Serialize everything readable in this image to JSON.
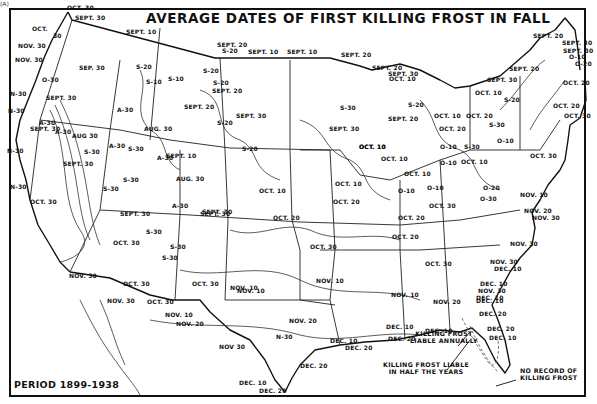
{
  "map": {
    "corner_mark": "(A)",
    "title": "AVERAGE DATES OF FIRST KILLING FROST IN FALL",
    "period": "PERIOD 1899-1938",
    "notes": {
      "annual": [
        "KILLING FROST",
        "LIABLE ANNUALLY"
      ],
      "half_years": [
        "KILLING FROST LIABLE",
        "IN HALF THE YEARS"
      ],
      "no_record": [
        "NO RECORD OF",
        "KILLING FROST"
      ]
    },
    "isoline_labels": [
      {
        "text": "OCT. 30",
        "x": 67,
        "y": 9
      },
      {
        "text": "SEPT. 30",
        "x": 75,
        "y": 19
      },
      {
        "text": "OCT.",
        "x": 32,
        "y": 30
      },
      {
        "text": "30",
        "x": 53,
        "y": 37
      },
      {
        "text": "NOV. 30",
        "x": 18,
        "y": 47
      },
      {
        "text": "NOV. 30",
        "x": 15,
        "y": 61
      },
      {
        "text": "SEPT. 10",
        "x": 126,
        "y": 33
      },
      {
        "text": "SEP. 30",
        "x": 79,
        "y": 69
      },
      {
        "text": "O-30",
        "x": 42,
        "y": 81
      },
      {
        "text": "N-30",
        "x": 10,
        "y": 95
      },
      {
        "text": "SEPT. 30",
        "x": 46,
        "y": 99
      },
      {
        "text": "S-20",
        "x": 136,
        "y": 68
      },
      {
        "text": "S-10",
        "x": 146,
        "y": 83
      },
      {
        "text": "S-10",
        "x": 168,
        "y": 80
      },
      {
        "text": "SEPT. 20",
        "x": 217,
        "y": 46
      },
      {
        "text": "S-20",
        "x": 222,
        "y": 52
      },
      {
        "text": "SEPT. 10",
        "x": 248,
        "y": 53
      },
      {
        "text": "SEPT. 10",
        "x": 287,
        "y": 53
      },
      {
        "text": "S-20",
        "x": 203,
        "y": 72
      },
      {
        "text": "S-20",
        "x": 213,
        "y": 84
      },
      {
        "text": "SEPT. 20",
        "x": 212,
        "y": 92
      },
      {
        "text": "SEPT. 20",
        "x": 341,
        "y": 56
      },
      {
        "text": "SEPT. 20",
        "x": 372,
        "y": 69
      },
      {
        "text": "SEPT. 30",
        "x": 388,
        "y": 75
      },
      {
        "text": "OCT. 10",
        "x": 389,
        "y": 80
      },
      {
        "text": "SEPT. 20",
        "x": 533,
        "y": 37
      },
      {
        "text": "SEPT. 30",
        "x": 562,
        "y": 44
      },
      {
        "text": "SEPT. 30",
        "x": 563,
        "y": 52
      },
      {
        "text": "O-10",
        "x": 569,
        "y": 58
      },
      {
        "text": "O-20",
        "x": 575,
        "y": 65
      },
      {
        "text": "OCT. 20",
        "x": 563,
        "y": 84
      },
      {
        "text": "SEPT. 20",
        "x": 509,
        "y": 70
      },
      {
        "text": "SEPT. 30",
        "x": 487,
        "y": 81
      },
      {
        "text": "OCT. 10",
        "x": 475,
        "y": 94
      },
      {
        "text": "S-20",
        "x": 504,
        "y": 101
      },
      {
        "text": "OCT. 20",
        "x": 553,
        "y": 107
      },
      {
        "text": "OCT. 30",
        "x": 564,
        "y": 117
      },
      {
        "text": "SEPT. 20",
        "x": 184,
        "y": 108
      },
      {
        "text": "A-30",
        "x": 117,
        "y": 111
      },
      {
        "text": "AUG. 30",
        "x": 144,
        "y": 130
      },
      {
        "text": "SEPT. 30",
        "x": 236,
        "y": 117
      },
      {
        "text": "S-20",
        "x": 217,
        "y": 124
      },
      {
        "text": "S-20",
        "x": 242,
        "y": 150
      },
      {
        "text": "N-30",
        "x": 8,
        "y": 112
      },
      {
        "text": "A-30",
        "x": 39,
        "y": 124
      },
      {
        "text": "A-30",
        "x": 55,
        "y": 133
      },
      {
        "text": "AUG 30",
        "x": 72,
        "y": 137
      },
      {
        "text": "A-30",
        "x": 109,
        "y": 147
      },
      {
        "text": "S-30",
        "x": 128,
        "y": 150
      },
      {
        "text": "N-30",
        "x": 7,
        "y": 152
      },
      {
        "text": "S-30",
        "x": 84,
        "y": 153
      },
      {
        "text": "SEPT. 30",
        "x": 63,
        "y": 165
      },
      {
        "text": "SEPT. 10",
        "x": 166,
        "y": 157
      },
      {
        "text": "A-30",
        "x": 157,
        "y": 159
      },
      {
        "text": "S-30",
        "x": 123,
        "y": 181
      },
      {
        "text": "N-30",
        "x": 10,
        "y": 188
      },
      {
        "text": "S-30",
        "x": 103,
        "y": 190
      },
      {
        "text": "AUG. 30",
        "x": 176,
        "y": 180
      },
      {
        "text": "OCT. 10",
        "x": 259,
        "y": 192
      },
      {
        "text": "SEPT. 30",
        "x": 30,
        "y": 130
      },
      {
        "text": "A-30",
        "x": 172,
        "y": 207
      },
      {
        "text": "SEPT. 30",
        "x": 202,
        "y": 213
      },
      {
        "text": "OCT. 30",
        "x": 30,
        "y": 203
      },
      {
        "text": "SEPT. 30",
        "x": 120,
        "y": 215
      },
      {
        "text": "S-30",
        "x": 146,
        "y": 233
      },
      {
        "text": "SEPT. 30",
        "x": 200,
        "y": 215
      },
      {
        "text": "OCT. 20",
        "x": 273,
        "y": 219
      },
      {
        "text": "S-30",
        "x": 170,
        "y": 248
      },
      {
        "text": "OCT. 30",
        "x": 113,
        "y": 244
      },
      {
        "text": "S-30",
        "x": 162,
        "y": 259
      },
      {
        "text": "OCT. 10",
        "x": 381,
        "y": 160
      },
      {
        "text": "SEPT. 30",
        "x": 329,
        "y": 130
      },
      {
        "text": "OCT. 10",
        "x": 359,
        "y": 148
      },
      {
        "text": "S-30",
        "x": 340,
        "y": 109
      },
      {
        "text": "S-20",
        "x": 408,
        "y": 106
      },
      {
        "text": "OCT. 10",
        "x": 434,
        "y": 117
      },
      {
        "text": "OCT. 20",
        "x": 466,
        "y": 117
      },
      {
        "text": "SEPT. 20",
        "x": 388,
        "y": 120
      },
      {
        "text": "OCT. 20",
        "x": 439,
        "y": 130
      },
      {
        "text": "S-30",
        "x": 489,
        "y": 126
      },
      {
        "text": "OCT. 10",
        "x": 359,
        "y": 148
      },
      {
        "text": "O-10",
        "x": 440,
        "y": 148
      },
      {
        "text": "O-10",
        "x": 440,
        "y": 164
      },
      {
        "text": "OCT. 10",
        "x": 461,
        "y": 163
      },
      {
        "text": "S-30",
        "x": 464,
        "y": 148
      },
      {
        "text": "O-10",
        "x": 497,
        "y": 142
      },
      {
        "text": "OCT. 30",
        "x": 530,
        "y": 157
      },
      {
        "text": "OCT. 10",
        "x": 404,
        "y": 175
      },
      {
        "text": "OCT. 10",
        "x": 335,
        "y": 185
      },
      {
        "text": "O-10",
        "x": 398,
        "y": 192
      },
      {
        "text": "O-10",
        "x": 427,
        "y": 189
      },
      {
        "text": "O-20",
        "x": 483,
        "y": 189
      },
      {
        "text": "NOV. 10",
        "x": 520,
        "y": 196
      },
      {
        "text": "OCT. 20",
        "x": 333,
        "y": 203
      },
      {
        "text": "OCT. 30",
        "x": 429,
        "y": 207
      },
      {
        "text": "OCT. 20",
        "x": 398,
        "y": 219
      },
      {
        "text": "O-30",
        "x": 480,
        "y": 200
      },
      {
        "text": "NOV. 20",
        "x": 524,
        "y": 212
      },
      {
        "text": "NOV. 30",
        "x": 532,
        "y": 219
      },
      {
        "text": "OCT. 20",
        "x": 392,
        "y": 238
      },
      {
        "text": "NOV. 30",
        "x": 510,
        "y": 245
      },
      {
        "text": "OCT. 30",
        "x": 310,
        "y": 248
      },
      {
        "text": "NOV. 30",
        "x": 490,
        "y": 263
      },
      {
        "text": "DEC. 10",
        "x": 494,
        "y": 270
      },
      {
        "text": "NOV. 10",
        "x": 237,
        "y": 292
      },
      {
        "text": "OCT. 30",
        "x": 425,
        "y": 265
      },
      {
        "text": "NOV. 10",
        "x": 316,
        "y": 282
      },
      {
        "text": "NOV. 10",
        "x": 391,
        "y": 296
      },
      {
        "text": "OCT. 30",
        "x": 123,
        "y": 285
      },
      {
        "text": "OCT. 30",
        "x": 192,
        "y": 285
      },
      {
        "text": "NOV. 10",
        "x": 230,
        "y": 289
      },
      {
        "text": "NOV. 30",
        "x": 69,
        "y": 277
      },
      {
        "text": "DEC. 10",
        "x": 480,
        "y": 285
      },
      {
        "text": "NOV. 30",
        "x": 478,
        "y": 292
      },
      {
        "text": "DEC. 10",
        "x": 476,
        "y": 299
      },
      {
        "text": "NOV. 30",
        "x": 107,
        "y": 302
      },
      {
        "text": "OCT. 30",
        "x": 147,
        "y": 303
      },
      {
        "text": "NOV. 10",
        "x": 165,
        "y": 316
      },
      {
        "text": "NOV. 20",
        "x": 176,
        "y": 325
      },
      {
        "text": "NOV. 20",
        "x": 289,
        "y": 322
      },
      {
        "text": "N-30",
        "x": 276,
        "y": 338
      },
      {
        "text": "NOV 30",
        "x": 219,
        "y": 348
      },
      {
        "text": "NOV. 20",
        "x": 433,
        "y": 303
      },
      {
        "text": "DEC. 10",
        "x": 476,
        "y": 302
      },
      {
        "text": "DEC. 20",
        "x": 479,
        "y": 315
      },
      {
        "text": "DEC. 10",
        "x": 386,
        "y": 328
      },
      {
        "text": "DEC. 20",
        "x": 487,
        "y": 330
      },
      {
        "text": "DEC. 10",
        "x": 489,
        "y": 339
      },
      {
        "text": "DEC. 10",
        "x": 425,
        "y": 332
      },
      {
        "text": "DEC. 20",
        "x": 388,
        "y": 340
      },
      {
        "text": "DEC. 10",
        "x": 330,
        "y": 342
      },
      {
        "text": "DEC. 20",
        "x": 345,
        "y": 349
      },
      {
        "text": "DEC. 20",
        "x": 300,
        "y": 367
      },
      {
        "text": "DEC. 10",
        "x": 239,
        "y": 384
      },
      {
        "text": "DEC. 20",
        "x": 259,
        "y": 392
      }
    ]
  }
}
